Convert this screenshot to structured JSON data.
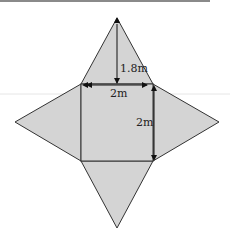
{
  "diagram": {
    "colors": {
      "fill": "#d4d4d4",
      "stroke": "#333333",
      "arrow": "#111111",
      "top_rule": "#8a8a8a",
      "faint_rule": "#e4e4e4"
    },
    "labels": {
      "slant_height": "1.8m",
      "base_width": "2m",
      "base_height": "2m"
    },
    "geometry": {
      "square": {
        "left": 81,
        "top": 84,
        "right": 153,
        "bottom": 161
      },
      "apex_top": [
        117,
        18
      ],
      "apex_left": [
        15,
        122
      ],
      "apex_right": [
        219,
        122
      ],
      "apex_bottom": [
        117,
        228
      ]
    }
  }
}
